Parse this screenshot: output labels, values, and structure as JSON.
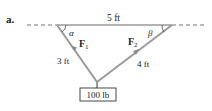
{
  "part_label": "a.",
  "top_span_label": "5 ft",
  "left_cable": {
    "length_label": "3 ft",
    "force_label": "F",
    "force_subscript": "1",
    "angle_label": "α"
  },
  "right_cable": {
    "length_label": "4 ft",
    "force_label": "F",
    "force_subscript": "2",
    "angle_label": "β"
  },
  "weight_label": "100 lb",
  "colors": {
    "line": "#555555",
    "cable": "#9a9a9a",
    "text": "#222222",
    "box_border": "#333333"
  }
}
